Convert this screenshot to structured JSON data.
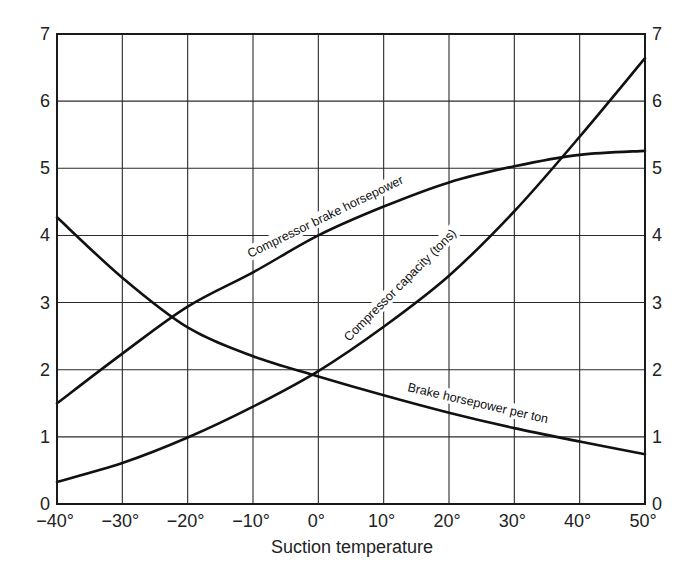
{
  "chart_data": {
    "type": "line",
    "title": "",
    "xlabel": "Suction temperature",
    "ylabel": "",
    "xlim": [
      -40,
      50
    ],
    "ylim": [
      0,
      7
    ],
    "grid": true,
    "legend": "inline curve labels",
    "x": [
      -40,
      -30,
      -20,
      -10,
      0,
      10,
      20,
      30,
      40,
      50
    ],
    "x_tick_labels": [
      "−40°",
      "−30°",
      "−20°",
      "−10°",
      "0°",
      "10°",
      "20°",
      "30°",
      "40°",
      "50°"
    ],
    "y_ticks": [
      0,
      1,
      2,
      3,
      4,
      5,
      6,
      7
    ],
    "y_tick_labels_left": [
      "0",
      "1",
      "2",
      "3",
      "4",
      "5",
      "6",
      "7"
    ],
    "y_tick_labels_right": [
      "0",
      "1",
      "2",
      "3",
      "4",
      "5",
      "6",
      "7"
    ],
    "series": [
      {
        "name": "Compressor brake horsepower",
        "values": [
          1.5,
          2.24,
          2.94,
          3.45,
          4.0,
          4.43,
          4.79,
          5.03,
          5.2,
          5.26
        ]
      },
      {
        "name": "Compressor capacity (tons)",
        "values": [
          0.33,
          0.61,
          0.99,
          1.45,
          1.98,
          2.64,
          3.4,
          4.36,
          5.47,
          6.64
        ]
      },
      {
        "name": "Brake horsepower per ton",
        "values": [
          4.27,
          3.37,
          2.63,
          2.2,
          1.9,
          1.62,
          1.36,
          1.13,
          0.93,
          0.74
        ]
      }
    ]
  },
  "labels": {
    "brake_hp": "Compressor brake horsepower",
    "capacity": "Compressor capacity (tons)",
    "hp_per_ton": "Brake horsepower per ton",
    "x_axis_title": "Suction temperature"
  }
}
